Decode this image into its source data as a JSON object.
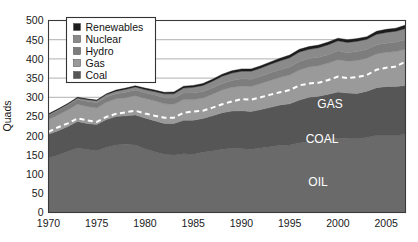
{
  "chart_data": {
    "type": "area",
    "title": "",
    "subtitle": "",
    "xlabel": "",
    "ylabel": "Quads",
    "xlim": [
      1970,
      2007
    ],
    "ylim": [
      0,
      500
    ],
    "ytick_step": 50,
    "grid": true,
    "stacked": true,
    "legend_position": "top-left",
    "x": [
      1970,
      1971,
      1972,
      1973,
      1974,
      1975,
      1976,
      1977,
      1978,
      1979,
      1980,
      1981,
      1982,
      1983,
      1984,
      1985,
      1986,
      1987,
      1988,
      1989,
      1990,
      1991,
      1992,
      1993,
      1994,
      1995,
      1996,
      1997,
      1998,
      1999,
      2000,
      2001,
      2002,
      2003,
      2004,
      2005,
      2006,
      2007
    ],
    "xtick_labels": [
      "1970",
      "1975",
      "1980",
      "1985",
      "1990",
      "1995",
      "2000",
      "2005"
    ],
    "xticks": [
      1970,
      1975,
      1980,
      1985,
      1990,
      1995,
      2000,
      2005
    ],
    "ytick_labels": [
      "0",
      "50",
      "100",
      "150",
      "200",
      "250",
      "300",
      "350",
      "400",
      "450",
      "500"
    ],
    "yticks": [
      0,
      50,
      100,
      150,
      200,
      250,
      300,
      350,
      400,
      450,
      500
    ],
    "series": [
      {
        "name": "Oil",
        "legend_name": "",
        "inline_label": "OIL",
        "color": "#6a6a6a",
        "values": [
          142,
          150,
          159,
          168,
          164,
          161,
          170,
          176,
          178,
          176,
          166,
          158,
          152,
          150,
          153,
          152,
          157,
          160,
          165,
          167,
          166,
          165,
          168,
          171,
          175,
          176,
          181,
          185,
          188,
          192,
          194,
          193,
          192,
          195,
          201,
          202,
          201,
          203
        ]
      },
      {
        "name": "Coal",
        "legend_name": "Coal",
        "inline_label": "COAL",
        "color": "#565656",
        "values": [
          62,
          63,
          65,
          69,
          68,
          68,
          72,
          74,
          74,
          78,
          80,
          81,
          80,
          82,
          87,
          88,
          88,
          92,
          95,
          97,
          99,
          98,
          100,
          103,
          105,
          107,
          112,
          115,
          115,
          116,
          120,
          118,
          118,
          121,
          124,
          126,
          127,
          128
        ]
      },
      {
        "name": "Gas",
        "legend_name": "Gas",
        "inline_label": "GAS",
        "color": "#9a9a9a",
        "values": [
          38,
          41,
          43,
          45,
          44,
          43,
          45,
          46,
          47,
          50,
          51,
          52,
          51,
          50,
          54,
          54,
          53,
          56,
          59,
          62,
          64,
          65,
          68,
          70,
          72,
          75,
          78,
          79,
          79,
          81,
          84,
          83,
          86,
          86,
          88,
          89,
          91,
          94
        ]
      },
      {
        "name": "Hydro",
        "legend_name": "Hydro",
        "inline_label": "",
        "color": "#7d7d7d",
        "values": [
          12,
          12,
          13,
          13,
          14,
          14,
          14,
          13,
          14,
          15,
          15,
          15,
          16,
          16,
          17,
          17,
          17,
          17,
          17,
          18,
          19,
          19,
          19,
          20,
          20,
          21,
          22,
          22,
          22,
          22,
          23,
          22,
          23,
          23,
          24,
          24,
          25,
          25
        ]
      },
      {
        "name": "Nuclear",
        "legend_name": "Nuclear",
        "inline_label": "",
        "color": "#8a8a8a",
        "values": [
          1,
          2,
          2,
          3,
          4,
          5,
          6,
          7,
          8,
          8,
          8,
          9,
          10,
          11,
          13,
          15,
          16,
          17,
          19,
          19,
          20,
          21,
          21,
          22,
          23,
          24,
          25,
          24,
          25,
          26,
          26,
          27,
          27,
          26,
          27,
          28,
          28,
          29
        ]
      },
      {
        "name": "Renewables",
        "legend_name": "Renewables",
        "inline_label": "",
        "color": "#1c1c1c",
        "values": [
          2,
          2,
          2,
          2,
          2,
          2,
          2,
          3,
          3,
          3,
          4,
          4,
          4,
          5,
          5,
          5,
          5,
          5,
          5,
          6,
          6,
          6,
          6,
          6,
          7,
          7,
          7,
          7,
          7,
          7,
          7,
          7,
          7,
          7,
          8,
          8,
          8,
          9
        ]
      }
    ],
    "overlay_line": {
      "name": "trend",
      "style": "dashed",
      "color": "#ffffff",
      "values": [
        210,
        222,
        232,
        245,
        240,
        236,
        249,
        257,
        261,
        265,
        258,
        252,
        247,
        247,
        260,
        263,
        265,
        273,
        282,
        289,
        295,
        294,
        300,
        307,
        313,
        319,
        331,
        336,
        338,
        345,
        354,
        350,
        353,
        358,
        372,
        377,
        380,
        393
      ]
    }
  },
  "legend": {
    "items": [
      {
        "label": "Renewables",
        "color": "#1c1c1c"
      },
      {
        "label": "Nuclear",
        "color": "#8a8a8a"
      },
      {
        "label": "Hydro",
        "color": "#7d7d7d"
      },
      {
        "label": "Gas",
        "color": "#9a9a9a"
      },
      {
        "label": "Coal",
        "color": "#565656"
      }
    ]
  },
  "inline_labels": [
    {
      "text": "GAS",
      "x": 330,
      "y": 108
    },
    {
      "text": "COAL",
      "x": 322,
      "y": 143
    },
    {
      "text": "OIL",
      "x": 318,
      "y": 186
    }
  ],
  "axes": {
    "y_title": "Quads"
  }
}
